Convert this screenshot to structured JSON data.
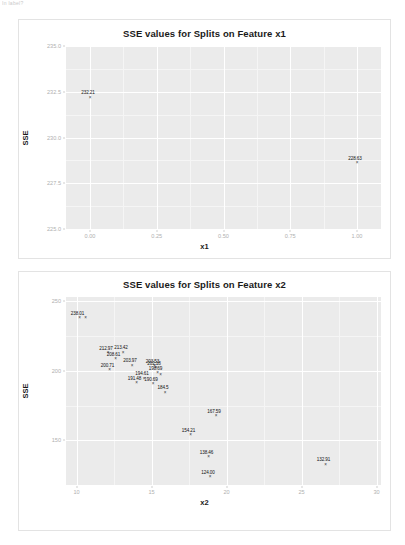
{
  "page": {
    "cut_text": "In label?"
  },
  "chart_data": [
    {
      "type": "scatter",
      "title": "SSE values for Splits on Feature x1",
      "xlabel": "x1",
      "ylabel": "SSE",
      "xlim": [
        -0.09,
        1.09
      ],
      "ylim": [
        225.0,
        235.0
      ],
      "xticks": [
        "0.00",
        "0.25",
        "0.50",
        "0.75",
        "1.00"
      ],
      "xtickvals": [
        0.0,
        0.25,
        0.5,
        0.75,
        1.0
      ],
      "yticks": [
        "235.0",
        "232.5",
        "230.0",
        "227.5",
        "225.0"
      ],
      "ytickvals": [
        235.0,
        232.5,
        230.0,
        227.5,
        225.0
      ],
      "grid": true,
      "legend": "none",
      "points": [
        {
          "x": 0.0,
          "y": 232.21,
          "label": "232.21"
        },
        {
          "x": 1.0,
          "y": 228.63,
          "label": "228.63"
        }
      ]
    },
    {
      "type": "scatter",
      "title": "SSE values for Splits on Feature x2",
      "xlabel": "x2",
      "ylabel": "SSE",
      "xlim": [
        9.3,
        30.3
      ],
      "ylim": [
        118.0,
        253.0
      ],
      "xticks": [
        "10",
        "15",
        "20",
        "25",
        "30"
      ],
      "xtickvals": [
        10,
        15,
        20,
        25,
        30
      ],
      "yticks": [
        "250",
        "200",
        "150"
      ],
      "ytickvals": [
        250,
        200,
        150
      ],
      "grid": true,
      "legend": "none",
      "points": [
        {
          "x": 10.2,
          "y": 238.01,
          "label": "238.01"
        },
        {
          "x": 10.6,
          "y": 238.01,
          "label": ""
        },
        {
          "x": 12.1,
          "y": 212.97,
          "label": "212.97"
        },
        {
          "x": 12.6,
          "y": 208.61,
          "label": "208.61"
        },
        {
          "x": 13.1,
          "y": 213.42,
          "label": "213.42"
        },
        {
          "x": 13.7,
          "y": 203.97,
          "label": "203.97"
        },
        {
          "x": 12.2,
          "y": 200.71,
          "label": "200.71"
        },
        {
          "x": 15.2,
          "y": 203.53,
          "label": "203.53"
        },
        {
          "x": 15.3,
          "y": 202.18,
          "label": "202.18"
        },
        {
          "x": 15.4,
          "y": 198.69,
          "label": "198.69"
        },
        {
          "x": 15.6,
          "y": 197.4,
          "label": ""
        },
        {
          "x": 14.5,
          "y": 194.61,
          "label": "194.61"
        },
        {
          "x": 15.1,
          "y": 190.69,
          "label": "190.69"
        },
        {
          "x": 14.0,
          "y": 191.48,
          "label": "191.48"
        },
        {
          "x": 15.9,
          "y": 184.5,
          "label": "184.5"
        },
        {
          "x": 19.3,
          "y": 167.59,
          "label": "167.59"
        },
        {
          "x": 17.6,
          "y": 154.21,
          "label": "154.21"
        },
        {
          "x": 18.8,
          "y": 138.46,
          "label": "138.46"
        },
        {
          "x": 18.9,
          "y": 124.0,
          "label": "124.00"
        },
        {
          "x": 26.6,
          "y": 132.91,
          "label": "132.91"
        }
      ]
    }
  ]
}
